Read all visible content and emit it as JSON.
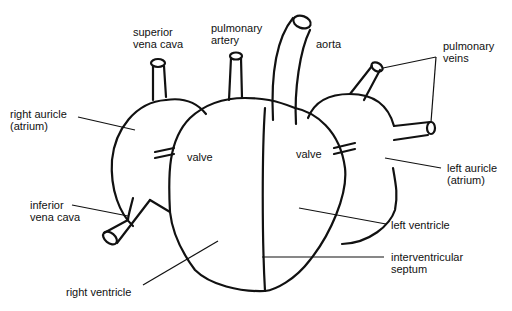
{
  "diagram": {
    "labels": {
      "superior_vena_cava": [
        "superior",
        "vena cava"
      ],
      "pulmonary_artery": [
        "pulmonary",
        "artery"
      ],
      "aorta": "aorta",
      "pulmonary_veins": [
        "pulmonary",
        "veins"
      ],
      "right_auricle": [
        "right auricle",
        "(atrium)"
      ],
      "valve_right": "valve",
      "valve_left": "valve",
      "left_auricle": [
        "left auricle",
        "(atrium)"
      ],
      "inferior_vena_cava": [
        "inferior",
        "vena cava"
      ],
      "left_ventricle": "left ventricle",
      "interventricular_septum": [
        "interventricular",
        "septum"
      ],
      "right_ventricle": "right ventricle"
    },
    "colors": {
      "ink": "#111111",
      "background": "#ffffff"
    }
  }
}
